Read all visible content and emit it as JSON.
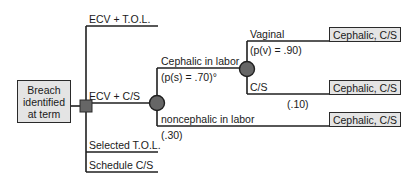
{
  "root": {
    "lines": [
      "Breach",
      "identified",
      "at term"
    ]
  },
  "strategies": {
    "ecv_tol": "ECV + T.O.L.",
    "ecv_cs": "ECV + C/S",
    "selected_tol": "Selected T.O.L.",
    "schedule_cs": "Schedule C/S"
  },
  "chance1": {
    "cephalic_label": "Cephalic in labor",
    "cephalic_prob": "(p(s) = .70)°",
    "noncephalic_label": "noncephalic in labor",
    "noncephalic_prob": "(.30)"
  },
  "chance2": {
    "vaginal_label": "Vaginal",
    "vaginal_prob": "(p(v) = .90)",
    "cs_label": "C/S",
    "cs_prob": "(.10)"
  },
  "terminals": [
    "Cephalic, C/S",
    "Cephalic, C/S",
    "Cephalic, C/S"
  ],
  "colors": {
    "line": "#1f1f1f",
    "node_fill": "#666666",
    "box_fill": "#e4e4e4"
  }
}
